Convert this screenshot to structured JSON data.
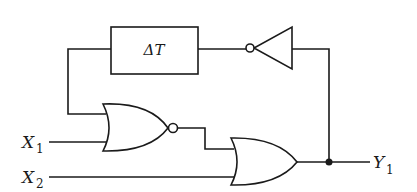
{
  "diagram": {
    "type": "logic-circuit",
    "colors": {
      "line": "#1a1a1a",
      "background": "#ffffff"
    },
    "delay_block": {
      "label": "ΔT"
    },
    "inputs": [
      {
        "name": "X",
        "subscript": "1"
      },
      {
        "name": "X",
        "subscript": "2"
      }
    ],
    "outputs": [
      {
        "name": "Y",
        "subscript": "1"
      }
    ],
    "gates": [
      {
        "id": "nor1",
        "kind": "NOR",
        "inputs": [
          "delay_block_out",
          "X1"
        ]
      },
      {
        "id": "or1",
        "kind": "OR",
        "inputs": [
          "nor1_out",
          "X2"
        ]
      },
      {
        "id": "inv1",
        "kind": "NOT",
        "inputs": [
          "Y1"
        ]
      }
    ],
    "connections": [
      "Y1 -> inv1 -> ΔT -> nor1.in1",
      "X1 -> nor1.in2",
      "nor1 -> or1.in1",
      "X2 -> or1.in2",
      "or1 -> Y1 (junction feeds back to inv1)"
    ]
  }
}
